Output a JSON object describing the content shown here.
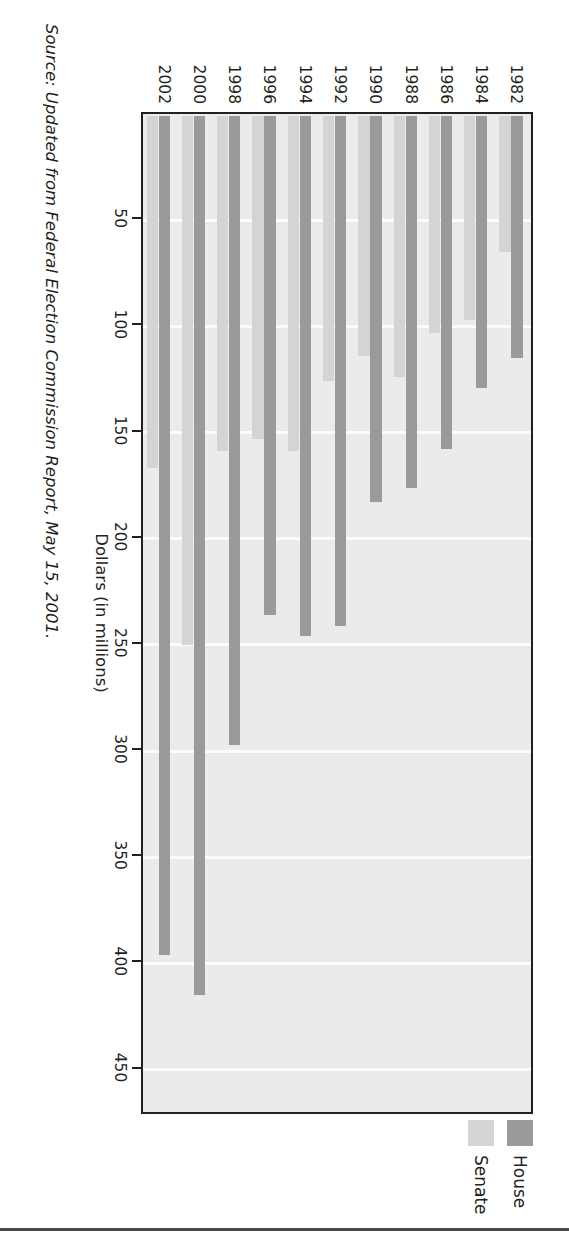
{
  "chart_data": {
    "type": "bar",
    "orientation": "horizontal",
    "title": "",
    "xlabel": "Dollars (in millions)",
    "ylabel": "",
    "categories": [
      "1982",
      "1984",
      "1986",
      "1988",
      "1990",
      "1992",
      "1994",
      "1996",
      "1998",
      "2000",
      "2002"
    ],
    "series": [
      {
        "name": "House",
        "color": "#9a9a9a",
        "values": [
          114,
          128,
          157,
          175,
          182,
          240,
          245,
          235,
          296,
          414,
          395
        ]
      },
      {
        "name": "Senate",
        "color": "#d4d4d4",
        "values": [
          64,
          96,
          102,
          123,
          113,
          125,
          158,
          152,
          158,
          249,
          166
        ]
      }
    ],
    "xticks": [
      450,
      400,
      350,
      300,
      250,
      200,
      150,
      100,
      50
    ],
    "xlim": [
      0,
      470
    ],
    "grid": true,
    "legend_position": "right",
    "legend": [
      "House",
      "Senate"
    ]
  },
  "axis": {
    "value_title": "Dollars (in millions)",
    "tick_labels": [
      "450",
      "400",
      "350",
      "300",
      "250",
      "200",
      "150",
      "100",
      "50"
    ],
    "year_labels": [
      "1982",
      "1984",
      "1986",
      "1988",
      "1990",
      "1992",
      "1994",
      "1996",
      "1998",
      "2000",
      "2002"
    ]
  },
  "legend": {
    "items": [
      {
        "label": "House",
        "swatch": "house-swatch"
      },
      {
        "label": "Senate",
        "swatch": "senate-swatch"
      }
    ]
  },
  "footer": {
    "source": "Source: Updated from Federal Election Commission Report, May 15, 2001."
  },
  "colors": {
    "house": "#9a9a9a",
    "senate": "#d4d4d4",
    "plot_background": "#ebebeb",
    "gridline": "#fcfcfc",
    "axis": "#231f20"
  }
}
